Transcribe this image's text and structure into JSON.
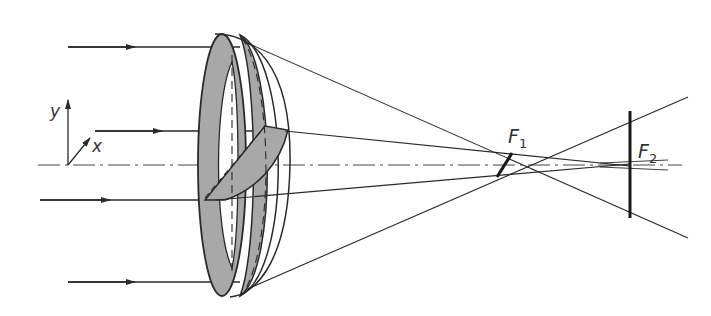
{
  "diagram": {
    "labels": {
      "y_axis": "y",
      "x_axis": "x",
      "focus1": "F",
      "focus1_sub": "1",
      "focus2": "F",
      "focus2_sub": "2"
    },
    "colors": {
      "line": "#2a2a2a",
      "lens_fill": "#a8a8a8",
      "background": "#ffffff"
    },
    "incoming_rays": [
      {
        "y": 47,
        "x_start": 68,
        "x_end": 240
      },
      {
        "y": 131,
        "x_start": 95,
        "x_end": 285
      },
      {
        "y": 200,
        "x_start": 40,
        "x_end": 210
      },
      {
        "y": 282,
        "x_start": 68,
        "x_end": 240
      }
    ],
    "optical_axis": {
      "y": 165,
      "x_start": 38,
      "x_end": 682,
      "style": "dash-dot"
    },
    "focal_points": [
      {
        "name": "F1",
        "x": 505,
        "y": 165
      },
      {
        "name": "F2",
        "x": 630,
        "y": 165
      }
    ]
  }
}
